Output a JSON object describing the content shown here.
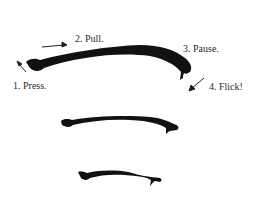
{
  "diagram": {
    "steps": [
      {
        "number": "1.",
        "text": "Press."
      },
      {
        "number": "2.",
        "text": "Pull."
      },
      {
        "number": "3.",
        "text": "Pause."
      },
      {
        "number": "4.",
        "text": "Flick!"
      }
    ],
    "labels": {
      "step1": "1. Press.",
      "step2": "2. Pull.",
      "step3": "3. Pause.",
      "step4": "4. Flick!"
    },
    "strokes": [
      {
        "name": "large-stroke",
        "size": "large"
      },
      {
        "name": "medium-stroke",
        "size": "medium"
      },
      {
        "name": "small-stroke",
        "size": "small"
      }
    ],
    "colors": {
      "ink": "#111111",
      "background": "#ffffff"
    }
  }
}
